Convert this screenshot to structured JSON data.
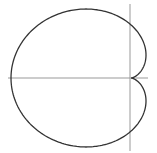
{
  "diagram": {
    "type": "polar-curve",
    "curve": "cardioid",
    "equation": "r = a(1 - cos θ)",
    "colors": {
      "background": "#ffffff",
      "curve": "#333333",
      "axes": "#999999"
    },
    "geometry": {
      "origin": [
        131,
        78
      ],
      "a": 60,
      "y_scale": 0.885,
      "x_axis": {
        "x1": 8,
        "x2": 148,
        "y": 78
      },
      "y_axis": {
        "x": 130,
        "y1": 4,
        "y2": 151
      }
    }
  }
}
